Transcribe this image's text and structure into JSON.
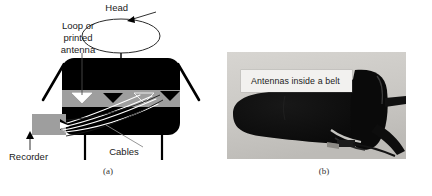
{
  "figure": {
    "panel_a": {
      "caption": "(a)",
      "labels": {
        "head": "Head",
        "antenna_line1": "Loop or",
        "antenna_line2": "printed",
        "antenna_line3": "antenna",
        "recorder": "Recorder",
        "cables": "Cables"
      },
      "colors": {
        "body": "#000000",
        "belt": "#9e9e9e",
        "recorder": "#9e9e9e",
        "outline": "#000000",
        "text": "#1a1a1a"
      }
    },
    "panel_b": {
      "caption": "(b)",
      "photo_label": "Antennas inside a belt",
      "colors": {
        "background": "#cfcdc9",
        "belt": "#0c0c0c",
        "label_box": "#f2f1ef",
        "label_text": "#1b1b1b"
      }
    }
  }
}
